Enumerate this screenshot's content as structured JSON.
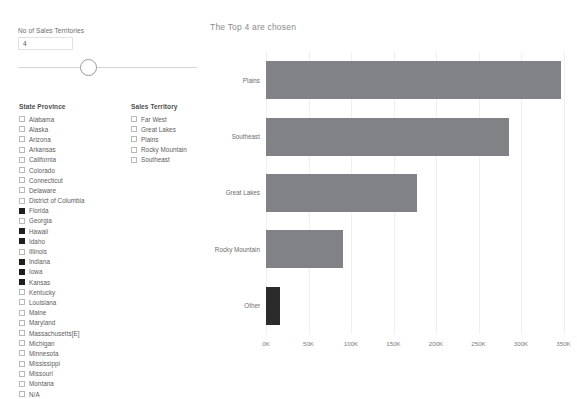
{
  "slider": {
    "label": "No of Sales Territories",
    "value": "4",
    "min": 1,
    "max": 10
  },
  "state_filter": {
    "title": "State Province",
    "items": [
      {
        "label": "Alabama",
        "checked": false
      },
      {
        "label": "Alaska",
        "checked": false
      },
      {
        "label": "Arizona",
        "checked": false
      },
      {
        "label": "Arkansas",
        "checked": false
      },
      {
        "label": "California",
        "checked": false
      },
      {
        "label": "Colorado",
        "checked": false
      },
      {
        "label": "Connecticut",
        "checked": false
      },
      {
        "label": "Delaware",
        "checked": false
      },
      {
        "label": "District of Columbia",
        "checked": false
      },
      {
        "label": "Florida",
        "checked": true
      },
      {
        "label": "Georgia",
        "checked": false
      },
      {
        "label": "Hawaii",
        "checked": true
      },
      {
        "label": "Idaho",
        "checked": true
      },
      {
        "label": "Illinois",
        "checked": false
      },
      {
        "label": "Indiana",
        "checked": true
      },
      {
        "label": "Iowa",
        "checked": true
      },
      {
        "label": "Kansas",
        "checked": true
      },
      {
        "label": "Kentucky",
        "checked": false
      },
      {
        "label": "Louisiana",
        "checked": false
      },
      {
        "label": "Maine",
        "checked": false
      },
      {
        "label": "Maryland",
        "checked": false
      },
      {
        "label": "Massachusetts[E]",
        "checked": false
      },
      {
        "label": "Michigan",
        "checked": false
      },
      {
        "label": "Minnesota",
        "checked": false
      },
      {
        "label": "Mississippi",
        "checked": false
      },
      {
        "label": "Missouri",
        "checked": false
      },
      {
        "label": "Montana",
        "checked": false
      },
      {
        "label": "N/A",
        "checked": false
      }
    ]
  },
  "territory_filter": {
    "title": "Sales Territory",
    "items": [
      {
        "label": "Far West",
        "checked": false
      },
      {
        "label": "Great Lakes",
        "checked": false
      },
      {
        "label": "Plains",
        "checked": false
      },
      {
        "label": "Rocky Mountain",
        "checked": false
      },
      {
        "label": "Southeast",
        "checked": false
      }
    ]
  },
  "chart_data": {
    "type": "bar",
    "orientation": "horizontal",
    "title": "The Top 4 are chosen",
    "xlabel": "",
    "ylabel": "",
    "categories": [
      "Plains",
      "Southeast",
      "Great Lakes",
      "Rocky Mountain",
      "Other"
    ],
    "values": [
      347000,
      286000,
      178000,
      90000,
      16000
    ],
    "tick_labels": [
      "0K",
      "50K",
      "100K",
      "150K",
      "200K",
      "250K",
      "300K",
      "350K"
    ],
    "tick_values": [
      0,
      50000,
      100000,
      150000,
      200000,
      250000,
      300000,
      350000
    ],
    "xlim": [
      0,
      360000
    ],
    "grid": true,
    "legend": "none",
    "bar_color": "#808285",
    "other_bar_color": "#2b2b2b"
  }
}
